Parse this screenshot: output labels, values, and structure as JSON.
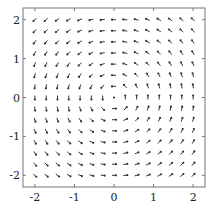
{
  "chart_data": {
    "type": "quiver",
    "title": "",
    "xlabel": "",
    "ylabel": "",
    "xlim": [
      -2.3,
      2.3
    ],
    "ylim": [
      -2.3,
      2.3
    ],
    "xticks": [
      -2,
      -1,
      0,
      1,
      2
    ],
    "yticks": [
      -2,
      -1,
      0,
      1,
      2
    ],
    "xtick_labels": [
      "-2",
      "-1",
      "0",
      "1",
      "2"
    ],
    "ytick_labels": [
      "-2",
      "-1",
      "0",
      "1",
      "2"
    ],
    "grid": false,
    "legend": null,
    "field": {
      "u": "-y",
      "v": "x",
      "description": "counter-clockwise rotational field"
    },
    "grid_points": {
      "x_start": -2,
      "x_end": 2,
      "y_start": -2,
      "y_end": 2,
      "count": 15
    },
    "arrow_color": "#333333",
    "frame_color": "#777777"
  }
}
